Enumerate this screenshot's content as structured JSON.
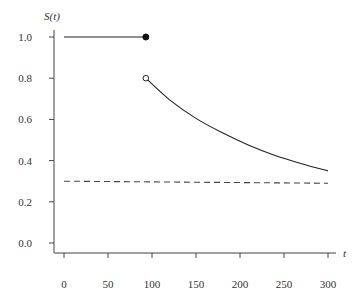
{
  "chart_data": {
    "type": "line",
    "title": "",
    "xlabel": "t",
    "ylabel": "S(t)",
    "xlim": [
      -10,
      310
    ],
    "ylim": [
      -0.02,
      1.05
    ],
    "x_ticks": [
      0,
      50,
      100,
      150,
      200,
      250,
      300
    ],
    "x_tick_labels": [
      "0",
      "50",
      "100",
      "150",
      "200",
      "250",
      "300"
    ],
    "y_ticks": [
      0.0,
      0.2,
      0.4,
      0.6,
      0.8,
      1.0
    ],
    "y_tick_labels": [
      "0.0",
      "0.2",
      "0.4",
      "0.6",
      "0.8",
      "1.0"
    ],
    "grid": false,
    "legend": null,
    "series": [
      {
        "name": "S(t) constant segment",
        "style": "solid",
        "color": "#222222",
        "x": [
          0,
          93
        ],
        "y": [
          1.0,
          1.0
        ],
        "end_marker": "filled-circle"
      },
      {
        "name": "S(t) decaying segment",
        "style": "solid",
        "color": "#222222",
        "start_marker": "open-circle",
        "x": [
          93,
          120,
          150,
          180,
          210,
          240,
          270,
          300
        ],
        "y": [
          0.8,
          0.695,
          0.605,
          0.535,
          0.475,
          0.425,
          0.385,
          0.35
        ]
      },
      {
        "name": "Reference level",
        "style": "dashed",
        "color": "#444444",
        "x": [
          0,
          300
        ],
        "y": [
          0.3,
          0.29
        ]
      }
    ],
    "annotations": [
      {
        "type": "filled-circle",
        "x": 93,
        "y": 1.0
      },
      {
        "type": "open-circle",
        "x": 93,
        "y": 0.8
      }
    ]
  }
}
